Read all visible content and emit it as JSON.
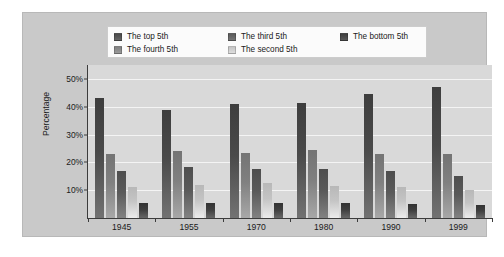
{
  "chart_data": {
    "type": "bar",
    "title": "",
    "xlabel": "",
    "ylabel": "Percentage",
    "categories": [
      "1945",
      "1955",
      "1970",
      "1980",
      "1990",
      "1999"
    ],
    "ylim": [
      0,
      55
    ],
    "ytick_labels": [
      "10%",
      "20%",
      "30%",
      "40%",
      "50%"
    ],
    "ytick_values": [
      10,
      20,
      30,
      40,
      50
    ],
    "grid": true,
    "legend_position": "top",
    "series": [
      {
        "name": "The top 5th",
        "color": "#4a4a4a",
        "values": [
          43.0,
          39.0,
          41.0,
          41.5,
          44.5,
          47.0
        ]
      },
      {
        "name": "The fourth 5th",
        "color": "#808080",
        "values": [
          23.0,
          24.0,
          23.5,
          24.5,
          23.0,
          23.0
        ]
      },
      {
        "name": "The third 5th",
        "color": "#5a5a5a",
        "values": [
          17.0,
          18.5,
          17.5,
          17.5,
          17.0,
          15.0
        ]
      },
      {
        "name": "The second 5th",
        "color": "#c4c4c4",
        "values": [
          11.0,
          12.0,
          12.5,
          11.5,
          11.0,
          10.0
        ]
      },
      {
        "name": "The bottom 5th",
        "color": "#3f3f3f",
        "values": [
          5.5,
          5.5,
          5.5,
          5.5,
          5.0,
          4.5
        ]
      }
    ]
  },
  "legend": {
    "entries": [
      {
        "label": "The top 5th",
        "color": "#4a4a4a"
      },
      {
        "label": "The third 5th",
        "color": "#5a5a5a"
      },
      {
        "label": "The bottom 5th",
        "color": "#3f3f3f"
      },
      {
        "label": "The fourth 5th",
        "color": "#808080"
      },
      {
        "label": "The second 5th",
        "color": "#c4c4c4"
      }
    ]
  },
  "colors": {
    "figure_panel": "#c9c9c9",
    "plot_background": "#d9d9d9",
    "gridline": "#f4f4f4",
    "axis": "#3c3c3c",
    "legend_background": "#fbfbfb",
    "text": "#1a1a1a"
  }
}
